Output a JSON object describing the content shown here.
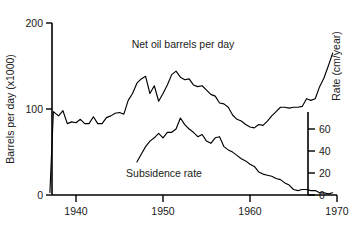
{
  "chart_data": {
    "type": "line",
    "title": "",
    "xlabel": "",
    "xlim": [
      1937,
      1970
    ],
    "xticks": [
      1940,
      1950,
      1960,
      1970
    ],
    "xticklabels": [
      "1940",
      "1950",
      "1960",
      "1970"
    ],
    "grid": false,
    "legend": "inline-annotations",
    "left_axis": {
      "label": "Barrels per day (x1000)",
      "ylim": [
        0,
        200
      ],
      "ticks": [
        0,
        100,
        200
      ],
      "ticklabels": [
        "0",
        "100",
        "200"
      ]
    },
    "right_axis": {
      "label": "Rate (cm/year)",
      "ylim": [
        0,
        75
      ],
      "ticks": [
        0,
        20,
        40,
        60
      ],
      "ticklabels": [
        "0",
        "20",
        "40",
        "60"
      ]
    },
    "annotations": [
      {
        "text": "Net oil barrels per day",
        "x": 1951.5,
        "y": 178
      },
      {
        "text": "Subsidence rate",
        "x": 1950.0,
        "y": 27
      }
    ],
    "series": [
      {
        "name": "Net oil barrels per day",
        "axis": "left",
        "units": "barrels per day (x1000)",
        "x": [
          1937.0,
          1937.4,
          1938.0,
          1938.5,
          1939.0,
          1939.5,
          1940.0,
          1940.5,
          1941.0,
          1941.5,
          1942.0,
          1942.5,
          1943.0,
          1943.5,
          1944.0,
          1944.5,
          1945.0,
          1945.5,
          1946.0,
          1946.5,
          1947.0,
          1947.5,
          1948.0,
          1948.5,
          1949.0,
          1949.5,
          1950.0,
          1950.5,
          1951.0,
          1951.5,
          1952.0,
          1952.5,
          1953.0,
          1953.5,
          1954.0,
          1954.5,
          1955.0,
          1955.5,
          1956.0,
          1956.5,
          1957.0,
          1957.5,
          1958.0,
          1958.5,
          1959.0,
          1959.5,
          1960.0,
          1960.5,
          1961.0,
          1961.5,
          1962.0,
          1962.5,
          1963.0,
          1963.5,
          1964.0,
          1964.5,
          1965.0,
          1965.5,
          1966.0,
          1966.5,
          1967.0,
          1967.5,
          1968.0,
          1968.5,
          1969.0,
          1969.5
        ],
        "y": [
          3,
          97,
          92,
          98,
          83,
          85,
          84,
          88,
          83,
          83,
          91,
          83,
          83,
          90,
          92,
          95,
          96,
          94,
          110,
          118,
          130,
          135,
          138,
          118,
          127,
          109,
          118,
          128,
          140,
          144,
          137,
          134,
          135,
          128,
          126,
          127,
          122,
          117,
          115,
          107,
          106,
          102,
          93,
          88,
          86,
          82,
          79,
          78,
          82,
          81,
          86,
          92,
          97,
          102,
          102,
          101,
          102,
          102,
          103,
          112,
          110,
          112,
          126,
          136,
          150,
          165
        ]
      },
      {
        "name": "Subsidence rate",
        "axis": "right",
        "units": "cm/year",
        "x": [
          1947.0,
          1947.5,
          1948.0,
          1948.5,
          1949.0,
          1949.5,
          1950.0,
          1950.5,
          1951.0,
          1951.5,
          1952.0,
          1952.5,
          1953.0,
          1953.5,
          1954.0,
          1954.5,
          1955.0,
          1955.5,
          1956.0,
          1956.5,
          1957.0,
          1957.5,
          1958.0,
          1958.5,
          1959.0,
          1959.5,
          1960.0,
          1960.5,
          1961.0,
          1961.5,
          1962.0,
          1962.5,
          1963.0,
          1963.5,
          1964.0,
          1964.5,
          1965.0,
          1965.5,
          1966.0,
          1966.5,
          1967.0,
          1967.5,
          1968.0,
          1968.5,
          1969.0,
          1969.5
        ],
        "y": [
          30,
          37,
          44,
          49,
          52,
          56,
          52,
          57,
          57,
          60,
          70,
          64,
          60,
          57,
          53,
          55,
          49,
          47,
          52,
          53,
          44,
          41,
          39,
          36,
          33,
          31,
          28,
          26,
          21,
          19,
          18,
          17,
          15,
          14,
          11,
          9,
          5,
          4,
          5,
          5,
          4,
          4,
          2,
          2,
          1,
          2
        ]
      }
    ]
  }
}
